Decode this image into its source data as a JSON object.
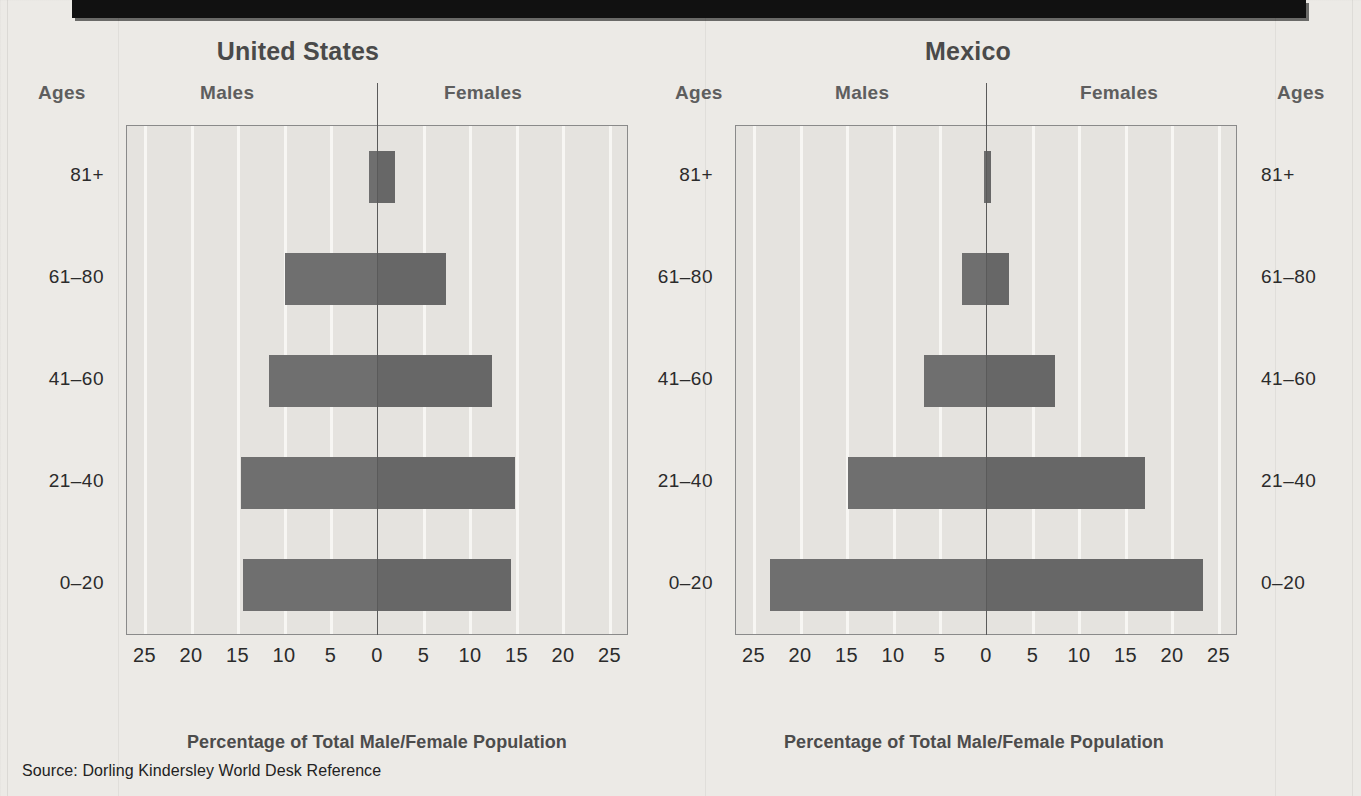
{
  "source_note": "Source:  Dorling Kindersley World Desk Reference",
  "labels": {
    "ages": "Ages",
    "males": "Males",
    "females": "Females",
    "axis_caption": "Percentage of Total Male/Female Population"
  },
  "colors": {
    "page_background": "#eceae6",
    "plot_background": "#e5e3df",
    "gridline": "#f7f6f3",
    "bar_male": "#6f6f6f",
    "bar_female": "#676767",
    "axis": "#5a5a5a",
    "header_band": "#111111",
    "title_text": "#4a4a4a"
  },
  "chart_data": [
    {
      "type": "bar",
      "title": "United States",
      "xlabel": "Percentage of Total Male/Female Population",
      "ylabel": "Ages",
      "categories": [
        "0–20",
        "21–40",
        "41–60",
        "61–80",
        "81+"
      ],
      "tick_labels": [
        "25",
        "20",
        "15",
        "10",
        "5",
        "0",
        "5",
        "10",
        "15",
        "20",
        "25"
      ],
      "tick_values": [
        -25,
        -20,
        -15,
        -10,
        -5,
        0,
        5,
        10,
        15,
        20,
        25
      ],
      "xlim": [
        -27,
        27
      ],
      "grid": true,
      "legend": "none",
      "series": [
        {
          "name": "Males",
          "side": "left",
          "values": [
            14.5,
            14.7,
            11.7,
            10.0,
            1.0
          ]
        },
        {
          "name": "Females",
          "side": "right",
          "values": [
            14.3,
            14.7,
            12.3,
            7.3,
            1.8
          ]
        }
      ]
    },
    {
      "type": "bar",
      "title": "Mexico",
      "xlabel": "Percentage of Total Male/Female Population",
      "ylabel": "Ages",
      "categories": [
        "0–20",
        "21–40",
        "41–60",
        "61–80",
        "81+"
      ],
      "tick_labels": [
        "25",
        "20",
        "15",
        "10",
        "5",
        "0",
        "5",
        "10",
        "15",
        "20",
        "25"
      ],
      "tick_values": [
        -25,
        -20,
        -15,
        -10,
        -5,
        0,
        5,
        10,
        15,
        20,
        25
      ],
      "xlim": [
        -27,
        27
      ],
      "grid": true,
      "legend": "none",
      "series": [
        {
          "name": "Males",
          "side": "left",
          "values": [
            23.3,
            15.0,
            6.8,
            2.7,
            0.3
          ]
        },
        {
          "name": "Females",
          "side": "right",
          "values": [
            23.2,
            17.0,
            7.3,
            2.4,
            0.4
          ]
        }
      ]
    }
  ]
}
